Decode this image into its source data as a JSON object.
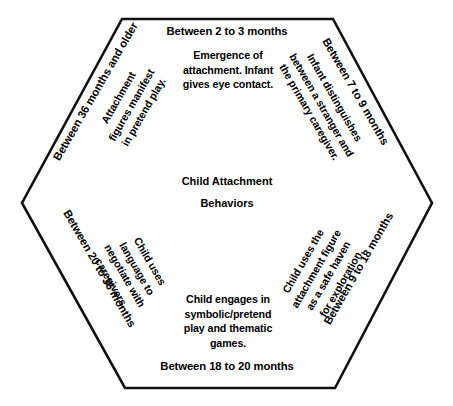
{
  "diagram": {
    "center_label": "Child Attachment\nBehaviors",
    "shape": "hexagon",
    "border_color": "#000000",
    "background_color": "#ffffff",
    "text_color": "#000000",
    "sectors": [
      {
        "id": "top",
        "position": "top",
        "heading": "Between 2 to 3 months",
        "body": "Emergence of\nattachment. Infant\ngives eye contact.",
        "rotation_deg": 0
      },
      {
        "id": "upper-right",
        "position": "upper-right",
        "heading": "Between 7 to 9 months",
        "body": "Infant distinguishes\nbetween a stranger and\nthe primary caregiver.",
        "rotation_deg": 60
      },
      {
        "id": "lower-right",
        "position": "lower-right",
        "heading": "Between 9 to 18 months",
        "body": "Child uses the\nattachment figure\nas a safe haven\nfor exploration.",
        "rotation_deg": -60
      },
      {
        "id": "bottom",
        "position": "bottom",
        "heading": "Between 18 to 20 months",
        "body": "Child engages in\nsymbolic/pretend\nplay and thematic\ngames.",
        "rotation_deg": 0
      },
      {
        "id": "lower-left",
        "position": "lower-left",
        "heading": "Between 20 to 36 months",
        "body": "Child uses\nlanguage to\nnegotiate with\ncaregivers.",
        "rotation_deg": 60
      },
      {
        "id": "upper-left",
        "position": "upper-left",
        "heading": "Between 36 months and older",
        "body": "Attachment\nfigures manifest\nin pretend play.",
        "rotation_deg": -60
      }
    ]
  }
}
